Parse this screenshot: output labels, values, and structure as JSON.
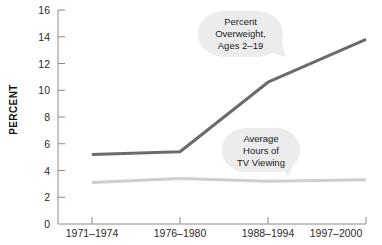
{
  "chart_data": {
    "type": "line",
    "title": "",
    "xlabel": "",
    "ylabel": "PERCENT",
    "categories": [
      "1971–1974",
      "1976–1980",
      "1988–1994",
      "1997–2000"
    ],
    "ylim": [
      0,
      16
    ],
    "yticks": [
      0,
      2,
      4,
      6,
      8,
      10,
      12,
      14,
      16
    ],
    "grid": false,
    "legend": "annotations",
    "series": [
      {
        "name": "Percent Overweight, Ages 2–19",
        "color": "#6b6b6b",
        "values": [
          5.2,
          5.4,
          10.6,
          13.8
        ]
      },
      {
        "name": "Average Hours of TV Viewing",
        "color": "#cfcfcf",
        "values": [
          3.1,
          3.4,
          3.2,
          3.3
        ]
      }
    ],
    "annotations": [
      {
        "name": "percent-overweight-callout",
        "lines": [
          "Percent",
          "Overweight,",
          "Ages 2–19"
        ]
      },
      {
        "name": "tv-viewing-callout",
        "lines": [
          "Average",
          "Hours of",
          "TV Viewing"
        ]
      }
    ]
  },
  "axis": {
    "y_title": "PERCENT",
    "y_tick_labels": [
      "16",
      "14",
      "12",
      "10",
      "8",
      "6",
      "4",
      "2",
      "0"
    ],
    "x_tick_labels": [
      "1971–1974",
      "1976–1980",
      "1988–1994",
      "1997–2000"
    ]
  },
  "callouts": {
    "overweight": {
      "line1": "Percent",
      "line2": "Overweight,",
      "line3": "Ages 2–19"
    },
    "tv": {
      "line1": "Average",
      "line2": "Hours of",
      "line3": "TV Viewing"
    }
  },
  "colors": {
    "overweight_line": "#6b6b6b",
    "tv_line": "#cfcfcf",
    "axis": "#8a8a8a",
    "bubble": "#ececec"
  }
}
